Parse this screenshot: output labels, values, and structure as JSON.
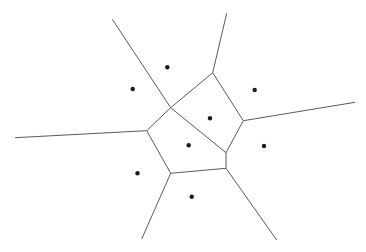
{
  "diagram": {
    "type": "voronoi",
    "width": 366,
    "height": 252,
    "background": "#ffffff",
    "edge_color": "#5a5a5a",
    "site_color": "#1a1a1a",
    "site_radius": 2.2,
    "sites": [
      {
        "x": 167.3,
        "y": 67.3
      },
      {
        "x": 132.7,
        "y": 89.0
      },
      {
        "x": 254.7,
        "y": 90.0
      },
      {
        "x": 210.0,
        "y": 118.3
      },
      {
        "x": 188.7,
        "y": 145.3
      },
      {
        "x": 264.0,
        "y": 146.0
      },
      {
        "x": 137.5,
        "y": 173.3
      },
      {
        "x": 191.7,
        "y": 196.7
      }
    ],
    "edges": [
      {
        "x1": 112.3,
        "y1": 19.3,
        "x2": 170.7,
        "y2": 107.7
      },
      {
        "x1": 226.7,
        "y1": 13.3,
        "x2": 212.7,
        "y2": 72.7
      },
      {
        "x1": 170.7,
        "y1": 107.7,
        "x2": 212.7,
        "y2": 72.7
      },
      {
        "x1": 212.7,
        "y1": 72.7,
        "x2": 243.3,
        "y2": 120.7
      },
      {
        "x1": 243.3,
        "y1": 120.7,
        "x2": 355.0,
        "y2": 102.3
      },
      {
        "x1": 170.7,
        "y1": 107.7,
        "x2": 146.7,
        "y2": 130.7
      },
      {
        "x1": 170.7,
        "y1": 107.7,
        "x2": 226.0,
        "y2": 152.7
      },
      {
        "x1": 243.3,
        "y1": 120.7,
        "x2": 226.0,
        "y2": 152.7
      },
      {
        "x1": 226.0,
        "y1": 152.7,
        "x2": 226.0,
        "y2": 168.3
      },
      {
        "x1": 15.0,
        "y1": 137.7,
        "x2": 146.7,
        "y2": 130.7
      },
      {
        "x1": 146.7,
        "y1": 130.7,
        "x2": 170.7,
        "y2": 173.3
      },
      {
        "x1": 170.7,
        "y1": 173.3,
        "x2": 226.0,
        "y2": 168.3
      },
      {
        "x1": 170.7,
        "y1": 173.3,
        "x2": 141.7,
        "y2": 239.0
      },
      {
        "x1": 226.0,
        "y1": 168.3,
        "x2": 276.7,
        "y2": 240.0
      }
    ]
  }
}
